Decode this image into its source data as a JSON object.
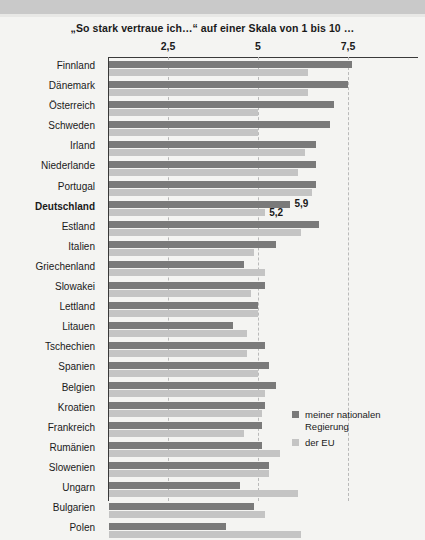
{
  "chart_data": {
    "type": "bar",
    "orientation": "horizontal",
    "title": "„So stark vertraue ich…“ auf einer Skala von 1 bis 10 …",
    "xlabel": "",
    "ylabel": "",
    "xlim": [
      1,
      8.2
    ],
    "xticks": [
      2.5,
      5,
      7.5
    ],
    "xtick_labels": [
      "2,5",
      "5",
      "7,5"
    ],
    "grid": true,
    "legend_position": "bottom-right",
    "categories": [
      "Finnland",
      "Dänemark",
      "Österreich",
      "Schweden",
      "Irland",
      "Niederlande",
      "Portugal",
      "Deutschland",
      "Estland",
      "Italien",
      "Griechenland",
      "Slowakei",
      "Lettland",
      "Litauen",
      "Tschechien",
      "Spanien",
      "Belgien",
      "Kroatien",
      "Frankreich",
      "Rumänien",
      "Slowenien",
      "Ungarn",
      "Bulgarien",
      "Polen"
    ],
    "highlight_category": "Deutschland",
    "series": [
      {
        "name": "meiner nationalen Regierung",
        "color": "#7a7a7a",
        "values": [
          7.6,
          7.5,
          7.1,
          7.0,
          6.6,
          6.6,
          6.6,
          5.9,
          6.7,
          5.5,
          4.6,
          5.2,
          5.0,
          4.3,
          5.2,
          5.3,
          5.5,
          5.2,
          5.1,
          5.1,
          5.3,
          4.5,
          4.9,
          4.1
        ]
      },
      {
        "name": "der EU",
        "color": "#c4c4c4",
        "values": [
          6.4,
          6.4,
          5.0,
          5.0,
          6.3,
          6.1,
          6.5,
          5.2,
          6.2,
          4.9,
          5.2,
          4.8,
          5.0,
          4.7,
          4.7,
          5.0,
          5.2,
          5.1,
          4.6,
          5.6,
          5.3,
          6.1,
          5.2,
          6.2
        ]
      }
    ],
    "data_labels": [
      {
        "category": "Deutschland",
        "series": "meiner nationalen Regierung",
        "text": "5,9"
      },
      {
        "category": "Deutschland",
        "series": "der EU",
        "text": "5,2"
      }
    ]
  },
  "legend": {
    "items": [
      {
        "label": "meiner nationalen\nRegierung",
        "color": "#7a7a7a"
      },
      {
        "label": "der EU",
        "color": "#c4c4c4"
      }
    ]
  }
}
